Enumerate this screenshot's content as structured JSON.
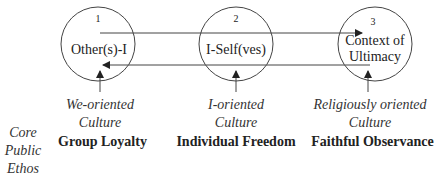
{
  "diagram": {
    "nodes": [
      {
        "number": "1",
        "label_lines": [
          "Other(s)-I"
        ],
        "orientation_lines": [
          "We-oriented",
          "Culture"
        ],
        "ethos": "Group Loyalty"
      },
      {
        "number": "2",
        "label_lines": [
          "I-Self(ves)"
        ],
        "orientation_lines": [
          "I-oriented",
          "Culture"
        ],
        "ethos": "Individual Freedom"
      },
      {
        "number": "3",
        "label_lines": [
          "Context of",
          "Ultimacy"
        ],
        "orientation_lines": [
          "Religiously oriented",
          "Culture"
        ],
        "ethos": "Faithful Observance"
      }
    ],
    "side_label_lines": [
      "Core",
      "Public",
      "Ethos"
    ],
    "edges": [
      {
        "from": "1",
        "to": "3",
        "direction": "right",
        "position": "upper"
      },
      {
        "from": "3",
        "to": "1",
        "direction": "left",
        "position": "lower"
      }
    ],
    "colors": {
      "line": "#333333",
      "text": "#222222",
      "background": "#ffffff"
    }
  }
}
